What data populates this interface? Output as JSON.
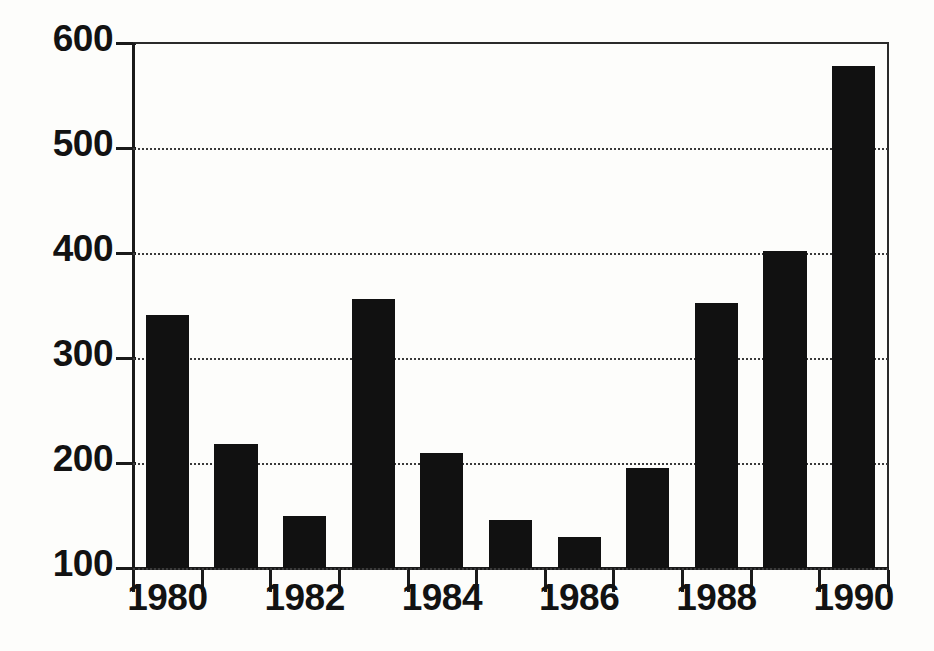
{
  "chart_data": {
    "type": "bar",
    "title": "",
    "subtitle": "",
    "xlabel": "",
    "ylabel": "",
    "categories": [
      "1980",
      "1981",
      "1982",
      "1983",
      "1984",
      "1985",
      "1986",
      "1987",
      "1988",
      "1989",
      "1990"
    ],
    "values": [
      341,
      218,
      150,
      356,
      210,
      146,
      130,
      195,
      352,
      402,
      578
    ],
    "series": [
      {
        "name": "",
        "values": [
          341,
          218,
          150,
          356,
          210,
          146,
          130,
          195,
          352,
          402,
          578
        ]
      }
    ],
    "ylim": [
      100,
      600
    ],
    "xlim": [
      "1980",
      "1990"
    ],
    "ytick_labels": [
      "600",
      "500",
      "400",
      "300",
      "200",
      "100"
    ],
    "ytick_values": [
      600,
      500,
      400,
      300,
      200,
      100
    ],
    "xtick_labels": [
      "1980",
      "1982",
      "1984",
      "1986",
      "1988",
      "1990"
    ],
    "xtick_values": [
      1980,
      1982,
      1984,
      1986,
      1988,
      1990
    ],
    "minor_xticks": [
      1981,
      1983,
      1985,
      1987,
      1989
    ],
    "grid": true,
    "grid_axis": "y",
    "grid_style": "dotted",
    "legend": false,
    "legend_position": "none",
    "bar_color": "#111111",
    "background_color": "#fdfdfb",
    "axis_color": "#1a1a1a",
    "annotations": []
  },
  "axes": {
    "y_labels": [
      {
        "text": "600",
        "value": 600
      },
      {
        "text": "500",
        "value": 500
      },
      {
        "text": "400",
        "value": 400
      },
      {
        "text": "300",
        "value": 300
      },
      {
        "text": "200",
        "value": 200
      },
      {
        "text": "100",
        "value": 100
      }
    ],
    "x_labels": [
      {
        "text": "1980",
        "value": 1980
      },
      {
        "text": "1982",
        "value": 1982
      },
      {
        "text": "1984",
        "value": 1984
      },
      {
        "text": "1986",
        "value": 1986
      },
      {
        "text": "1988",
        "value": 1988
      },
      {
        "text": "1990",
        "value": 1990
      }
    ]
  }
}
